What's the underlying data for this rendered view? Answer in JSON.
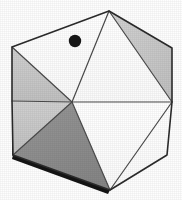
{
  "figure": {
    "canvas": {
      "width": 182,
      "height": 200,
      "background": "#fefefe"
    },
    "colors": {
      "outline": "#2b2b2b",
      "interior_line": "#4a4a4a",
      "face_white": "#fdfdfd",
      "face_light_gray": "#c9c9c9",
      "face_mid_gray": "#b0b0b0",
      "face_dark_gray": "#8d8d8d",
      "shadow_edge": "#1a1a1a",
      "dot": "#171717"
    },
    "vertices": {
      "top": [
        109,
        11
      ],
      "upper_left": [
        12,
        47
      ],
      "upper_right": [
        172,
        48
      ],
      "right_mid": [
        172,
        102
      ],
      "lower_left": [
        13,
        155
      ],
      "lower_right": [
        167,
        155
      ],
      "bottom": [
        110,
        190
      ],
      "center": [
        72,
        102
      ],
      "mid_right_inner": [
        172,
        102
      ],
      "left_mid": [
        12,
        101
      ]
    },
    "faces": [
      {
        "name": "upper-left-white-face",
        "shade": "white",
        "points": "12,47 109,11 72,102"
      },
      {
        "name": "upper-center-white-face",
        "shade": "white",
        "points": "109,11 172,102 72,102"
      },
      {
        "name": "upper-right-gray-face",
        "shade": "light",
        "points": "109,11 172,48 172,102"
      },
      {
        "name": "left-upper-gray-face",
        "shade": "light",
        "points": "12,47 72,102 12,101"
      },
      {
        "name": "left-lower-gray-face",
        "shade": "light",
        "points": "12,101 72,102 13,155"
      },
      {
        "name": "bottom-left-dark-face",
        "shade": "dark",
        "points": "13,155 72,102 110,190"
      },
      {
        "name": "bottom-center-white-face",
        "shade": "white",
        "points": "72,102 172,102 110,190"
      },
      {
        "name": "bottom-right-white-face",
        "shade": "white",
        "points": "172,102 167,155 110,190"
      }
    ],
    "edges": [
      {
        "name": "edge-upper-left-to-top",
        "from": [
          12,
          47
        ],
        "to": [
          109,
          11
        ],
        "kind": "outline"
      },
      {
        "name": "edge-top-to-upper-right",
        "from": [
          109,
          11
        ],
        "to": [
          172,
          48
        ],
        "kind": "outline"
      },
      {
        "name": "edge-upper-right-to-right-mid",
        "from": [
          172,
          48
        ],
        "to": [
          172,
          102
        ],
        "kind": "outline"
      },
      {
        "name": "edge-right-mid-to-lower-right",
        "from": [
          172,
          102
        ],
        "to": [
          167,
          155
        ],
        "kind": "outline"
      },
      {
        "name": "edge-lower-right-to-bottom",
        "from": [
          167,
          155
        ],
        "to": [
          110,
          190
        ],
        "kind": "outline"
      },
      {
        "name": "edge-bottom-to-lower-left",
        "from": [
          110,
          190
        ],
        "to": [
          13,
          155
        ],
        "kind": "outline"
      },
      {
        "name": "edge-lower-left-to-left-mid",
        "from": [
          13,
          155
        ],
        "to": [
          12,
          101
        ],
        "kind": "outline"
      },
      {
        "name": "edge-left-mid-to-upper-left",
        "from": [
          12,
          101
        ],
        "to": [
          12,
          47
        ],
        "kind": "outline"
      },
      {
        "name": "edge-upper-left-to-center",
        "from": [
          12,
          47
        ],
        "to": [
          72,
          102
        ],
        "kind": "interior"
      },
      {
        "name": "edge-top-to-center",
        "from": [
          109,
          11
        ],
        "to": [
          72,
          102
        ],
        "kind": "interior"
      },
      {
        "name": "edge-top-to-right-mid",
        "from": [
          109,
          11
        ],
        "to": [
          172,
          102
        ],
        "kind": "interior"
      },
      {
        "name": "edge-center-to-right-mid",
        "from": [
          72,
          102
        ],
        "to": [
          172,
          102
        ],
        "kind": "interior"
      },
      {
        "name": "edge-center-to-left-mid",
        "from": [
          72,
          102
        ],
        "to": [
          12,
          101
        ],
        "kind": "interior"
      },
      {
        "name": "edge-center-to-lower-left",
        "from": [
          72,
          102
        ],
        "to": [
          13,
          155
        ],
        "kind": "interior"
      },
      {
        "name": "edge-center-to-bottom",
        "from": [
          72,
          102
        ],
        "to": [
          110,
          190
        ],
        "kind": "interior"
      },
      {
        "name": "edge-right-mid-to-bottom",
        "from": [
          172,
          102
        ],
        "to": [
          110,
          190
        ],
        "kind": "interior"
      }
    ],
    "marker": {
      "name": "dot-marker",
      "cx": 75,
      "cy": 41,
      "r": 6.2,
      "fill": "#171717"
    }
  }
}
